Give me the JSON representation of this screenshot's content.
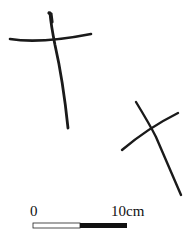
{
  "figure": {
    "objects": [
      {
        "name": "cross-object-1"
      },
      {
        "name": "cross-object-2"
      }
    ],
    "scale_bar": {
      "start_label": "0",
      "end_label": "10cm",
      "colors": {
        "segment_1": "#ffffff",
        "segment_2": "#111111",
        "outline": "#222222"
      }
    },
    "colors": {
      "stroke": "#1a1a1a",
      "background": "#ffffff"
    }
  }
}
